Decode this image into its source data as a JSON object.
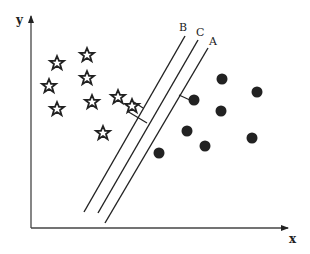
{
  "diagram": {
    "title": "",
    "colors": {
      "ink": "#222222",
      "background": "#ffffff"
    },
    "axes": {
      "x_label": "x",
      "y_label": "y"
    },
    "lines": [
      {
        "label": "B",
        "x1": 185,
        "y1": 36,
        "x2": 84,
        "y2": 212
      },
      {
        "label": "C",
        "x1": 198,
        "y1": 40,
        "x2": 98,
        "y2": 213
      },
      {
        "label": "A",
        "x1": 208,
        "y1": 48,
        "x2": 105,
        "y2": 223
      }
    ],
    "classes": [
      {
        "name": "stars",
        "marker": "star-icon"
      },
      {
        "name": "circles",
        "marker": "filled-circle-icon"
      }
    ],
    "stars": [
      {
        "x": 57,
        "y": 63
      },
      {
        "x": 87,
        "y": 55
      },
      {
        "x": 87,
        "y": 78
      },
      {
        "x": 49,
        "y": 86
      },
      {
        "x": 57,
        "y": 109
      },
      {
        "x": 92,
        "y": 102
      },
      {
        "x": 118,
        "y": 97
      },
      {
        "x": 132,
        "y": 106
      },
      {
        "x": 103,
        "y": 133
      }
    ],
    "circles": [
      {
        "x": 222,
        "y": 79
      },
      {
        "x": 257,
        "y": 92
      },
      {
        "x": 194,
        "y": 100
      },
      {
        "x": 221,
        "y": 111
      },
      {
        "x": 187,
        "y": 131
      },
      {
        "x": 252,
        "y": 138
      },
      {
        "x": 205,
        "y": 146
      },
      {
        "x": 159,
        "y": 153
      }
    ]
  }
}
